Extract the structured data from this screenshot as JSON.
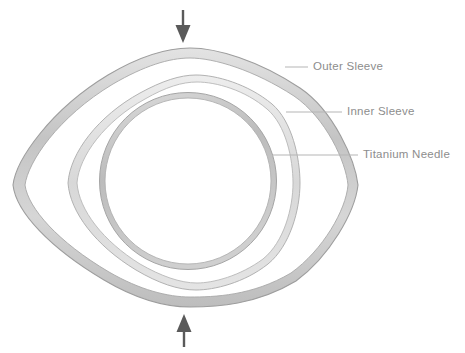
{
  "diagram": {
    "background_color": "#ffffff",
    "label_color": "#8d8d8d",
    "leader_line_color": "#b5b5b5",
    "arrow_color": "#5a5a5a",
    "labels": [
      {
        "id": "outer-sleeve",
        "text": "Outer Sleeve",
        "leader_start_x": 285,
        "leader_end_x": 308,
        "leader_y": 67
      },
      {
        "id": "inner-sleeve",
        "text": "Inner Sleeve",
        "leader_start_x": 286,
        "leader_end_x": 342,
        "leader_y": 112
      },
      {
        "id": "titanium-needle",
        "text": "Titanium Needle",
        "leader_start_x": 273,
        "leader_end_x": 358,
        "leader_y": 155
      }
    ],
    "arrows": [
      {
        "id": "top-arrow",
        "direction": "down",
        "x": 183,
        "tail_y": 10,
        "tip_y": 42,
        "color": "#5a5a5a"
      },
      {
        "id": "bottom-arrow",
        "direction": "up",
        "x": 184,
        "tail_y": 347,
        "tip_y": 315,
        "color": "#5a5a5a"
      }
    ],
    "components": [
      {
        "id": "outer-sleeve-body",
        "name": "Outer Sleeve",
        "shape": "vesica",
        "left_vertex_x": 13,
        "right_vertex_x": 358,
        "center_y": 185,
        "top_y": 48,
        "bottom_y": 307,
        "band_color": "#cfcfcf",
        "stroke_color": "#9a9a9a"
      },
      {
        "id": "inner-sleeve-body",
        "name": "Inner Sleeve",
        "shape": "vesica",
        "left_vertex_x": 68,
        "right_vertex_x": 300,
        "center_y": 183,
        "top_y": 72,
        "bottom_y": 290,
        "band_color": "#e8e8e8",
        "stroke_color": "#b0b0b0"
      },
      {
        "id": "titanium-needle-body",
        "name": "Titanium Needle",
        "shape": "circle",
        "center_x": 188,
        "center_y": 181,
        "radius": 88,
        "band_color": "#d4d4d4",
        "stroke_color": "#a8a8a8"
      }
    ]
  }
}
